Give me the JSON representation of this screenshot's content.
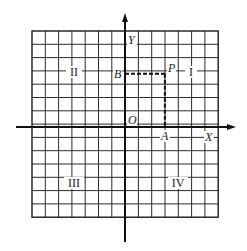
{
  "diagram": {
    "type": "cartesian-coordinate-grid",
    "grid": {
      "left": 32,
      "top": 31,
      "cell": 13.3,
      "cols": 14,
      "rows": 14,
      "line_color": "#2a2a2a",
      "border_color": "#1a1a1a"
    },
    "axes": {
      "x_label": "X",
      "y_label": "Y",
      "origin_label": "O",
      "origin": {
        "x": 125,
        "y": 127
      },
      "x_axis_from": 16,
      "x_axis_to": 236,
      "y_axis_from": 13,
      "y_axis_to": 242,
      "color": "#111111"
    },
    "points": {
      "P": {
        "label": "P",
        "grid_x": 3,
        "grid_y": 4
      },
      "A": {
        "label": "A",
        "grid_x": 3,
        "grid_y": 0
      },
      "B": {
        "label": "B",
        "grid_x": 0,
        "grid_y": 4
      }
    },
    "projection_style": "dashed",
    "quadrants": [
      {
        "numeral": "I",
        "x": 191,
        "y": 76
      },
      {
        "numeral": "II",
        "x": 74,
        "y": 76
      },
      {
        "numeral": "III",
        "x": 74,
        "y": 187
      },
      {
        "numeral": "IV",
        "x": 178,
        "y": 187
      }
    ]
  }
}
